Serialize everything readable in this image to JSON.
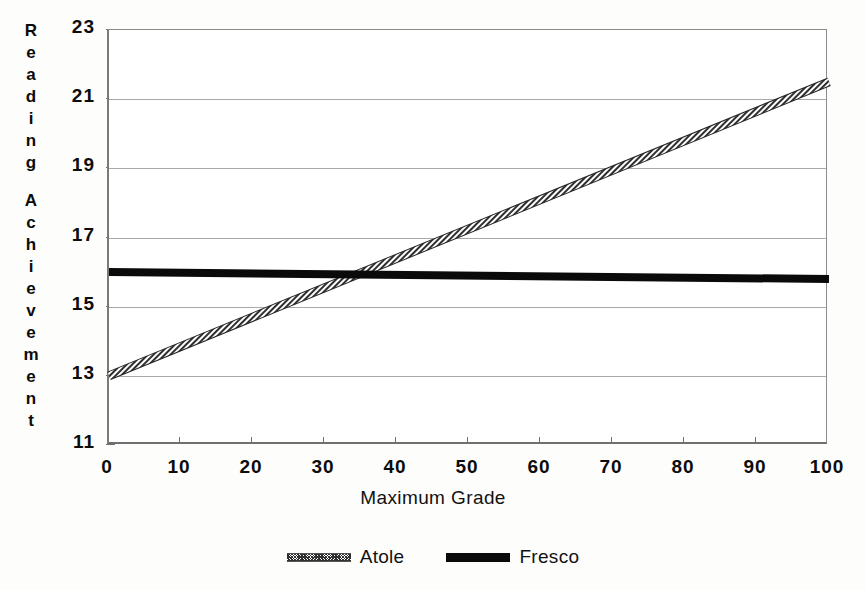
{
  "chart_data": {
    "type": "line",
    "title": "",
    "xlabel": "Maximum Grade",
    "ylabel": "Reading Achievement",
    "xlim": [
      0,
      100
    ],
    "ylim": [
      11,
      23
    ],
    "xticks": [
      "0",
      "10",
      "20",
      "30",
      "40",
      "50",
      "60",
      "70",
      "80",
      "90",
      "100"
    ],
    "yticks": [
      "11",
      "13",
      "15",
      "17",
      "19",
      "21",
      "23"
    ],
    "grid": "horizontal",
    "legend_position": "bottom-center",
    "series": [
      {
        "name": "Atole",
        "style": "hatched-gray-thick",
        "color": "#3a3a3a",
        "x": [
          0,
          100
        ],
        "values": [
          13.0,
          21.5
        ]
      },
      {
        "name": "Fresco",
        "style": "solid-black-thick",
        "color": "#0a0a0a",
        "x": [
          0,
          100
        ],
        "values": [
          16.0,
          15.8
        ]
      }
    ],
    "annotations": [
      {
        "text": "lines intersect",
        "x": 34,
        "y": 16.0
      }
    ]
  },
  "axes": {
    "ylabel_chars": [
      "R",
      "e",
      "a",
      "d",
      "i",
      "n",
      "g",
      " ",
      "A",
      "c",
      "h",
      "i",
      "e",
      "v",
      "e",
      "m",
      "e",
      "n",
      "t"
    ]
  },
  "legend": {
    "items": [
      {
        "label": "Atole"
      },
      {
        "label": "Fresco"
      }
    ]
  }
}
